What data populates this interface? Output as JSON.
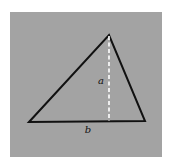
{
  "figure": {
    "labels": {
      "height": "a",
      "base": "b"
    },
    "colors": {
      "background": "#a3a3a3",
      "triangle_stroke": "#111111",
      "altitude_stroke": "#ffffff"
    }
  }
}
